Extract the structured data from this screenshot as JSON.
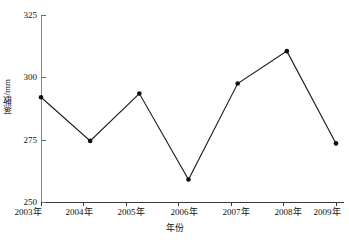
{
  "chart_data": {
    "type": "line",
    "title": "",
    "subtitle": "",
    "xlabel": "年份",
    "ylabel": "蒸散/mm",
    "categories": [
      "2003年",
      "2004年",
      "2005年",
      "2006年",
      "2007年",
      "2008年",
      "2009年"
    ],
    "values": [
      292,
      274.5,
      293.5,
      259,
      297.5,
      310.5,
      273.5
    ],
    "series": [
      {
        "name": "蒸散量",
        "values": [
          292,
          274.5,
          293.5,
          259,
          297.5,
          310.5,
          273.5
        ]
      }
    ],
    "ylim": [
      250,
      325
    ],
    "yticks": [
      250,
      275,
      300,
      325
    ],
    "ytick_labels": [
      "250",
      "275",
      "300",
      "325"
    ],
    "xlim": [
      0,
      7
    ],
    "grid": false,
    "legend": false,
    "legend_position": "none",
    "marker": "filled-circle",
    "line_color": "#1a1a1a",
    "marker_color": "#111111",
    "axis_color": "#3a3a3a",
    "background_color": "#ffffff",
    "annotations": []
  },
  "axes": {
    "y_title": "蒸散/mm",
    "x_title": "年份",
    "y_tick_labels": [
      "325",
      "300",
      "275",
      "250"
    ],
    "x_tick_labels": [
      "2003年",
      "2004年",
      "2005年",
      "2006年",
      "2007年",
      "2008年",
      "2009年"
    ]
  }
}
